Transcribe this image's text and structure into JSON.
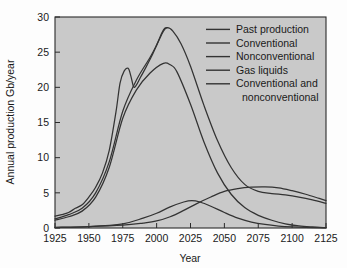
{
  "chart_data": {
    "type": "line",
    "title": "",
    "xlabel": "Year",
    "ylabel": "Annual production Gb/year",
    "xlim": [
      1925,
      2125
    ],
    "ylim": [
      0,
      30
    ],
    "grid": false,
    "legend_position": "top-right",
    "xticks": [
      "1925",
      "1950",
      "1975",
      "2000",
      "2025",
      "2050",
      "2075",
      "2100",
      "2125"
    ],
    "xtick_values": [
      1925,
      1950,
      1975,
      2000,
      2025,
      2050,
      2075,
      2100,
      2125
    ],
    "yticks": [
      "0",
      "5",
      "10",
      "15",
      "20",
      "25",
      "30"
    ],
    "ytick_values": [
      0,
      5,
      10,
      15,
      20,
      25,
      30
    ],
    "series": [
      {
        "name": "Past production",
        "color": "#333333",
        "x": [
          1925,
          1930,
          1935,
          1940,
          1945,
          1950,
          1955,
          1960,
          1965,
          1970,
          1973,
          1976,
          1979,
          1981,
          1983,
          1985,
          1988,
          1992,
          1996,
          2000,
          2004,
          2006,
          2008
        ],
        "values": [
          1.7,
          1.9,
          2.2,
          2.8,
          3.3,
          4.4,
          5.8,
          7.8,
          11.0,
          16.5,
          20.6,
          22.3,
          22.7,
          21.6,
          20.1,
          20.3,
          21.4,
          22.8,
          24.3,
          26.0,
          27.8,
          28.4,
          28.5
        ]
      },
      {
        "name": "Conventional",
        "color": "#333333",
        "x": [
          1925,
          1935,
          1945,
          1955,
          1965,
          1975,
          1985,
          1995,
          2005,
          2010,
          2015,
          2025,
          2035,
          2045,
          2055,
          2065,
          2075,
          2085,
          2095,
          2105,
          2115,
          2125
        ],
        "values": [
          1.1,
          1.6,
          2.4,
          4.4,
          8.6,
          15.6,
          19.6,
          22.0,
          23.4,
          23.2,
          22.2,
          17.6,
          12.2,
          7.8,
          4.8,
          2.9,
          1.8,
          1.1,
          0.6,
          0.3,
          0.15,
          0.05
        ]
      },
      {
        "name": "Nonconventional",
        "color": "#333333",
        "x": [
          1925,
          1950,
          1975,
          1990,
          2000,
          2010,
          2020,
          2030,
          2040,
          2050,
          2060,
          2070,
          2080,
          2090,
          2100,
          2110,
          2120,
          2125
        ],
        "values": [
          0.1,
          0.2,
          0.4,
          0.7,
          1.0,
          1.6,
          2.5,
          3.5,
          4.4,
          5.2,
          5.6,
          5.8,
          5.85,
          5.7,
          5.3,
          4.8,
          4.2,
          3.9
        ]
      },
      {
        "name": "Gas liquids",
        "color": "#333333",
        "x": [
          1925,
          1950,
          1975,
          1990,
          2000,
          2010,
          2020,
          2026,
          2032,
          2040,
          2050,
          2060,
          2070,
          2080,
          2090,
          2100,
          2110,
          2125
        ],
        "values": [
          0.05,
          0.2,
          0.6,
          1.4,
          2.1,
          3.0,
          3.7,
          3.9,
          3.7,
          3.1,
          2.2,
          1.4,
          0.85,
          0.5,
          0.28,
          0.15,
          0.08,
          0.03
        ]
      },
      {
        "name": "Conventional and nonconventional",
        "color": "#333333",
        "x": [
          1925,
          1935,
          1945,
          1955,
          1965,
          1975,
          1985,
          1995,
          2000,
          2005,
          2008,
          2012,
          2018,
          2025,
          2035,
          2045,
          2055,
          2065,
          2075,
          2085,
          2095,
          2105,
          2115,
          2125
        ],
        "values": [
          1.3,
          1.9,
          2.8,
          5.0,
          9.4,
          16.6,
          21.0,
          24.2,
          26.0,
          28.0,
          28.5,
          28.0,
          26.2,
          23.0,
          17.4,
          12.4,
          8.6,
          6.2,
          5.2,
          4.9,
          4.7,
          4.4,
          4.0,
          3.5
        ]
      }
    ],
    "legend": [
      "Past production",
      "Conventional",
      "Nonconventional",
      "Gas liquids",
      "Conventional and",
      "nonconventional"
    ]
  },
  "colors": {
    "plot_background": "#c9c9c9",
    "figure_background": "#fdfdfd",
    "line": "#333333",
    "axis": "#2b2b2b",
    "text": "#1a1a1a"
  }
}
